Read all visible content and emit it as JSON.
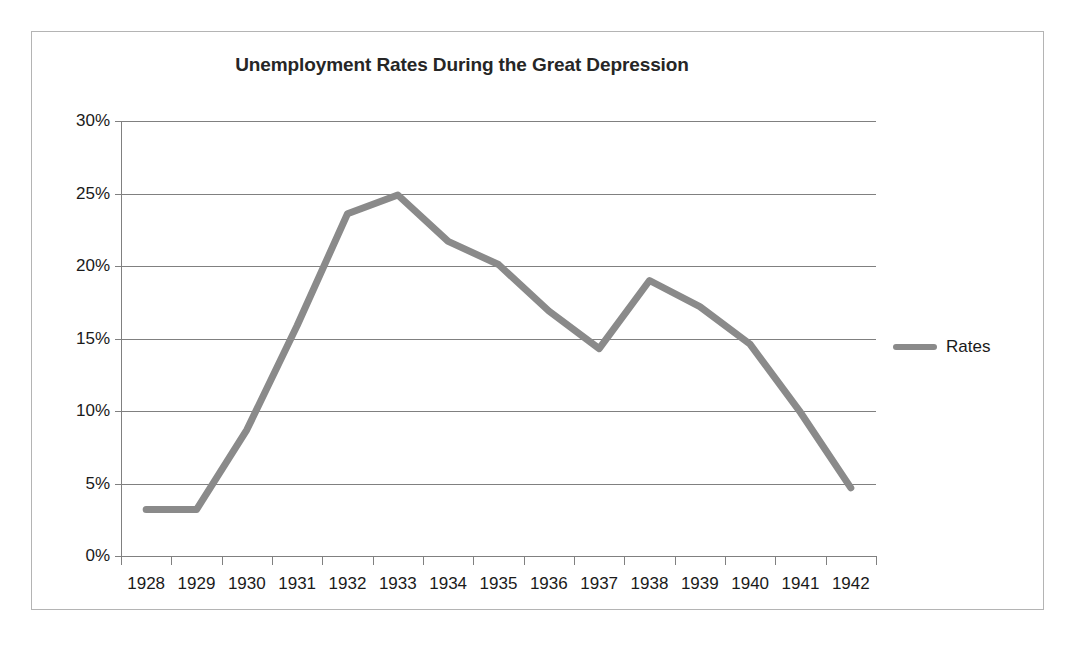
{
  "chart_data": {
    "type": "line",
    "title": "Unemployment Rates During the Great Depression",
    "xlabel": "",
    "ylabel": "",
    "categories": [
      "1928",
      "1929",
      "1930",
      "1931",
      "1932",
      "1933",
      "1934",
      "1935",
      "1936",
      "1937",
      "1938",
      "1939",
      "1940",
      "1941",
      "1942"
    ],
    "series": [
      {
        "name": "Rates",
        "color": "#8a8a8a",
        "values": [
          3.2,
          3.2,
          8.7,
          15.9,
          23.6,
          24.9,
          21.7,
          20.1,
          16.9,
          14.3,
          19.0,
          17.2,
          14.6,
          9.9,
          4.7
        ]
      }
    ],
    "ylim": [
      0,
      30
    ],
    "y_ticks": [
      0,
      5,
      10,
      15,
      20,
      25,
      30
    ],
    "y_tick_labels": [
      "0%",
      "5%",
      "10%",
      "15%",
      "20%",
      "25%",
      "30%"
    ],
    "grid": true,
    "legend_position": "right",
    "legend_entries": [
      "Rates"
    ]
  },
  "legend": {
    "label": "Rates",
    "swatch_color": "#8a8a8a"
  },
  "style": {
    "border_color": "#b4b4b4",
    "grid_color": "#808080",
    "axis_color": "#808080",
    "text_color": "#1a1a1a",
    "title_color": "#262626",
    "background": "#ffffff"
  }
}
